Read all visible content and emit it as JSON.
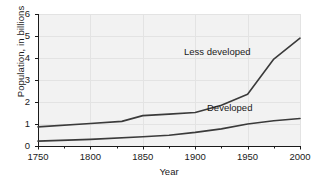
{
  "chart_data": {
    "type": "line",
    "title": "",
    "xlabel": "Year",
    "ylabel": "Population, in billions",
    "xlim": [
      1750,
      2000
    ],
    "ylim": [
      0,
      6
    ],
    "xticks": [
      1750,
      1800,
      1850,
      1900,
      1950,
      2000
    ],
    "xticklabels": [
      "1750",
      "1800",
      "1850",
      "1900",
      "1950",
      "2000"
    ],
    "yticks": [
      0,
      1,
      2,
      3,
      4,
      5,
      6
    ],
    "yticklabels": [
      "0",
      "1",
      "2",
      "3",
      "4",
      "5",
      "6"
    ],
    "minor_xticks": [
      1775,
      1825,
      1875,
      1925,
      1975
    ],
    "grid": true,
    "legend_position": "inline-annotations",
    "plot_background": "#f2f2f2",
    "line_color": "#3a3a3a",
    "series": [
      {
        "name": "Less developed",
        "annotation": "Less developed",
        "x": [
          1750,
          1800,
          1830,
          1850,
          1875,
          1900,
          1925,
          1950,
          1975,
          2000
        ],
        "values": [
          0.87,
          1.02,
          1.12,
          1.38,
          1.45,
          1.52,
          1.85,
          2.35,
          3.95,
          4.9
        ]
      },
      {
        "name": "Developed",
        "annotation": "Developed",
        "x": [
          1750,
          1800,
          1850,
          1875,
          1900,
          1925,
          1950,
          1975,
          2000
        ],
        "values": [
          0.22,
          0.3,
          0.42,
          0.49,
          0.62,
          0.78,
          1.0,
          1.15,
          1.25
        ]
      }
    ]
  },
  "annotations": {
    "less_developed_label": "Less developed",
    "developed_label": "Developed"
  }
}
